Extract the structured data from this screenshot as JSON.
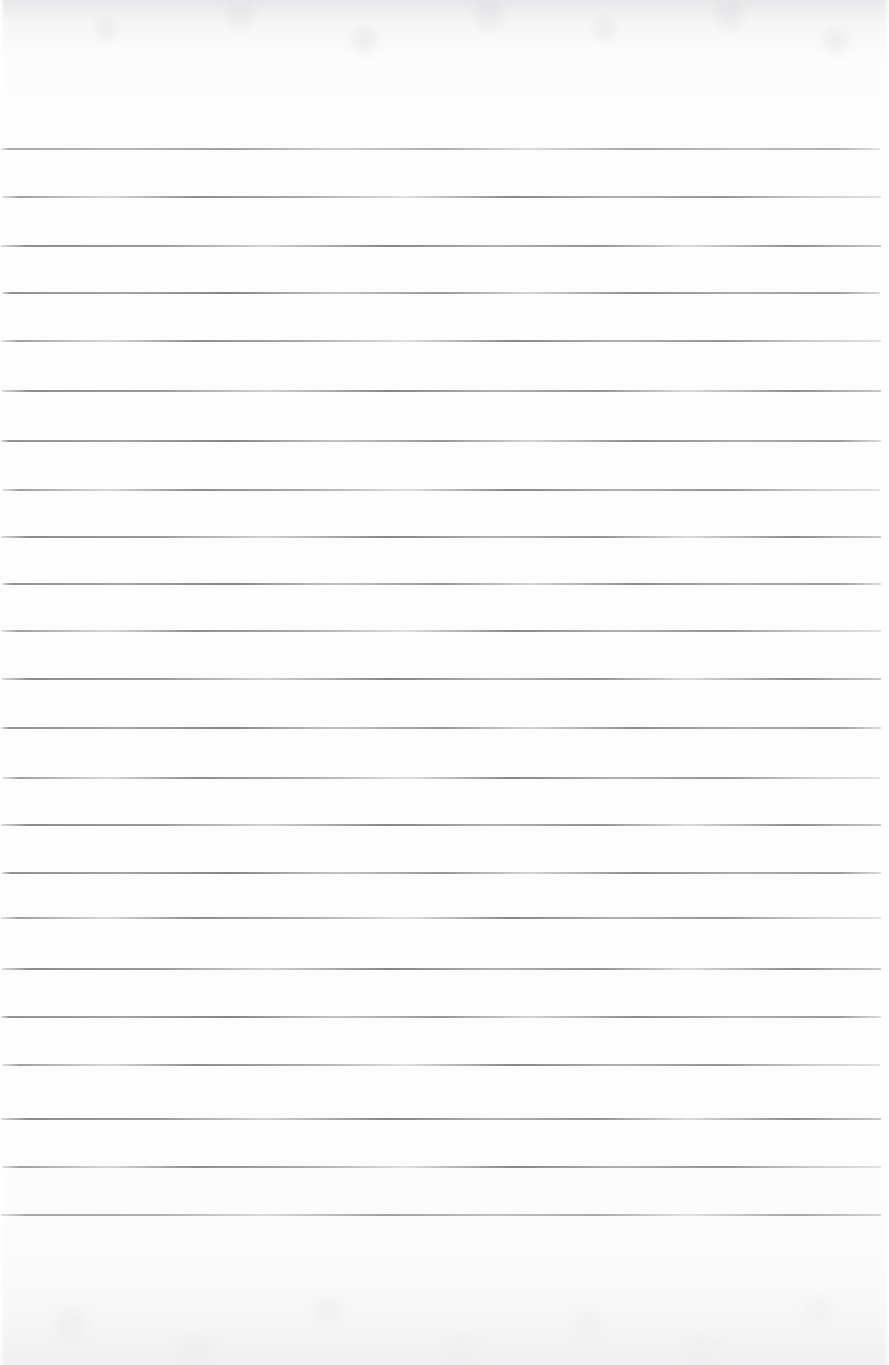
{
  "document": {
    "kind": "scanned-ruled-paper",
    "title": "",
    "page_width": 889,
    "page_height": 1365,
    "text_content": "",
    "is_blank": true,
    "paper_color": "#fdfdfd",
    "rule_color": "#9a9a9e",
    "rule_color_dark": "#8d8d92",
    "edge_shade_color": "#e4e4e7",
    "top_margin": 148,
    "bottom_margin": 150,
    "rule_count": 23,
    "rule_spacing": 48.5,
    "rule_left": 2,
    "rule_right": 881,
    "vertical_margin_rule": false,
    "punch_holes": false
  },
  "rules": [
    {
      "y": 148,
      "left": 1,
      "width": 879,
      "weight": "thin",
      "variant": "",
      "faint": true
    },
    {
      "y": 196,
      "left": 2,
      "width": 879,
      "weight": "",
      "variant": "alt",
      "faint": false
    },
    {
      "y": 245,
      "left": 1,
      "width": 880,
      "weight": "",
      "variant": "alt2",
      "faint": false
    },
    {
      "y": 292,
      "left": 2,
      "width": 878,
      "weight": "thick",
      "variant": "",
      "faint": false
    },
    {
      "y": 340,
      "left": 1,
      "width": 880,
      "weight": "",
      "variant": "alt",
      "faint": false
    },
    {
      "y": 390,
      "left": 2,
      "width": 879,
      "weight": "",
      "variant": "alt2",
      "faint": false
    },
    {
      "y": 440,
      "left": 1,
      "width": 880,
      "weight": "thick",
      "variant": "",
      "faint": false
    },
    {
      "y": 489,
      "left": 2,
      "width": 878,
      "weight": "",
      "variant": "alt",
      "faint": false
    },
    {
      "y": 536,
      "left": 1,
      "width": 880,
      "weight": "",
      "variant": "alt2",
      "faint": false
    },
    {
      "y": 583,
      "left": 2,
      "width": 879,
      "weight": "thick",
      "variant": "",
      "faint": false
    },
    {
      "y": 630,
      "left": 1,
      "width": 880,
      "weight": "",
      "variant": "alt",
      "faint": false
    },
    {
      "y": 678,
      "left": 2,
      "width": 879,
      "weight": "",
      "variant": "alt2",
      "faint": false
    },
    {
      "y": 727,
      "left": 1,
      "width": 880,
      "weight": "thick",
      "variant": "",
      "faint": false
    },
    {
      "y": 777,
      "left": 2,
      "width": 878,
      "weight": "",
      "variant": "alt",
      "faint": false
    },
    {
      "y": 824,
      "left": 1,
      "width": 880,
      "weight": "",
      "variant": "alt2",
      "faint": false
    },
    {
      "y": 872,
      "left": 2,
      "width": 879,
      "weight": "thick",
      "variant": "",
      "faint": false
    },
    {
      "y": 917,
      "left": 1,
      "width": 880,
      "weight": "",
      "variant": "alt",
      "faint": false
    },
    {
      "y": 968,
      "left": 2,
      "width": 879,
      "weight": "",
      "variant": "alt2",
      "faint": false
    },
    {
      "y": 1016,
      "left": 1,
      "width": 880,
      "weight": "thick",
      "variant": "",
      "faint": false
    },
    {
      "y": 1064,
      "left": 2,
      "width": 878,
      "weight": "",
      "variant": "alt",
      "faint": false
    },
    {
      "y": 1118,
      "left": 1,
      "width": 880,
      "weight": "",
      "variant": "alt2",
      "faint": false
    },
    {
      "y": 1166,
      "left": 2,
      "width": 879,
      "weight": "",
      "variant": "alt",
      "faint": false
    },
    {
      "y": 1214,
      "left": 1,
      "width": 880,
      "weight": "thin",
      "variant": "alt2",
      "faint": true
    }
  ]
}
